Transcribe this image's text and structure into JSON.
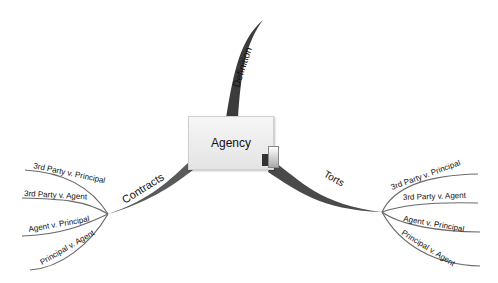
{
  "central_node": {
    "label": "Agency"
  },
  "branches": {
    "definition": {
      "label": "Definition"
    },
    "contracts": {
      "label": "Contracts",
      "children": [
        "3rd Party v. Principal",
        "3rd Party v. Agent",
        "Agent v. Principal",
        "Principal v. Agent"
      ]
    },
    "torts": {
      "label": "Torts",
      "children": [
        "3rd Party v. Principal",
        "3rd Party v. Agent",
        "Agent v. Principal",
        "Principal v. Agent"
      ]
    }
  },
  "colors": {
    "branch": "#4a4a4a",
    "subbranch": "#6a6a6a",
    "node_fill": "#eeeeee",
    "background": "#ffffff"
  }
}
